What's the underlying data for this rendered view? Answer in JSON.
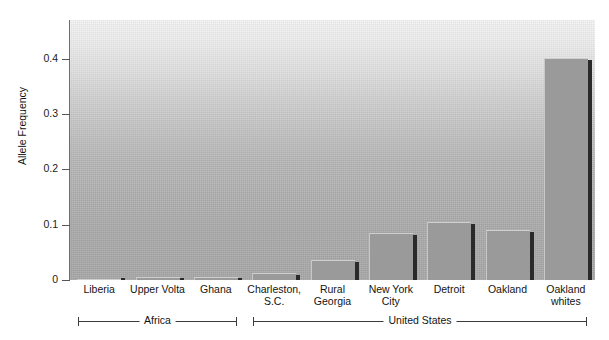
{
  "chart_data": {
    "type": "bar",
    "title": "",
    "subtitle": "",
    "xlabel": "",
    "ylabel": "Allele Frequency",
    "categories": [
      "Liberia",
      "Upper Volta",
      "Ghana",
      "Charleston,\nS.C.",
      "Rural\nGeorgia",
      "New York\nCity",
      "Detroit",
      "Oakland",
      "Oakland\nwhites"
    ],
    "values": [
      0.002,
      0.005,
      0.006,
      0.012,
      0.036,
      0.085,
      0.104,
      0.09,
      0.402
    ],
    "ylim": [
      0,
      0.47
    ],
    "yticks": [
      0,
      0.1,
      0.2,
      0.3,
      0.4
    ],
    "ytick_labels": [
      "0",
      "0.1",
      "0.2",
      "0.3",
      "0.4"
    ],
    "grid": false,
    "legend": null,
    "groups": [
      {
        "label": "Africa",
        "members": [
          "Liberia",
          "Upper Volta",
          "Ghana"
        ]
      },
      {
        "label": "United States",
        "members": [
          "Charleston, S.C.",
          "Rural Georgia",
          "New York City",
          "Detroit",
          "Oakland",
          "Oakland whites"
        ]
      }
    ],
    "colors": {
      "bar_fill": "#9a9a9a",
      "bar_shadow": "#2a2a2a",
      "plot_background_top": "#f4f4f4",
      "plot_background_bottom": "#a8a8a8",
      "axis": "#6e6e6e",
      "text": "#131313"
    }
  },
  "axis": {
    "y_title": "Allele Frequency",
    "ticks": [
      {
        "label": "0.4",
        "value": 0.4
      },
      {
        "label": "0.3",
        "value": 0.3
      },
      {
        "label": "0.2",
        "value": 0.2
      },
      {
        "label": "0.1",
        "value": 0.1
      },
      {
        "label": "0",
        "value": 0
      }
    ]
  },
  "bars": [
    {
      "label": "Liberia",
      "value": 0.002
    },
    {
      "label": "Upper Volta",
      "value": 0.005
    },
    {
      "label": "Ghana",
      "value": 0.006
    },
    {
      "label": "Charleston,\nS.C.",
      "value": 0.012
    },
    {
      "label": "Rural\nGeorgia",
      "value": 0.036
    },
    {
      "label": "New York\nCity",
      "value": 0.085
    },
    {
      "label": "Detroit",
      "value": 0.104
    },
    {
      "label": "Oakland",
      "value": 0.09
    },
    {
      "label": "Oakland\nwhites",
      "value": 0.402
    }
  ],
  "groups": [
    {
      "label": "Africa"
    },
    {
      "label": "United States"
    }
  ]
}
